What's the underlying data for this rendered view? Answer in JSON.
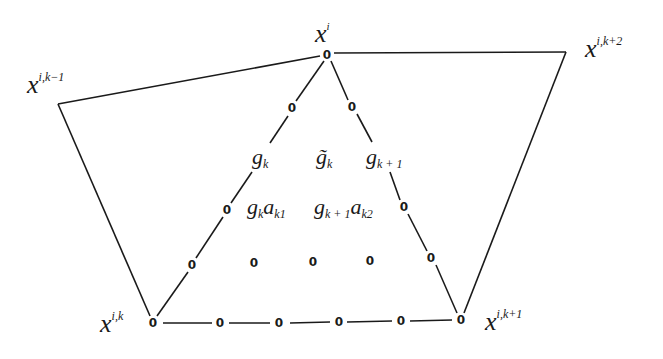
{
  "diagram": {
    "vertices": {
      "apex": {
        "label_base": "x",
        "label_sup": "i",
        "value": "0",
        "x": 327,
        "y": 54
      },
      "bottom_left": {
        "label_base": "x",
        "label_sup": "i,k",
        "value": "0",
        "x": 153,
        "y": 323
      },
      "bottom_right": {
        "label_base": "x",
        "label_sup": "i,k+1",
        "value": "0",
        "x": 461,
        "y": 320
      },
      "left_outer": {
        "label_base": "x",
        "label_sup": "i,k−1",
        "x": 58,
        "y": 104
      },
      "right_outer": {
        "label_base": "x",
        "label_sup": "i,k+2",
        "x": 566,
        "y": 52
      }
    },
    "left_edge_zeros": [
      {
        "value": "0",
        "x": 292,
        "y": 108
      },
      {
        "value": "0",
        "x": 227,
        "y": 210
      },
      {
        "value": "0",
        "x": 192,
        "y": 265
      }
    ],
    "right_edge_zeros": [
      {
        "value": "0",
        "x": 352,
        "y": 107
      },
      {
        "value": "0",
        "x": 404,
        "y": 207
      },
      {
        "value": "0",
        "x": 431,
        "y": 258
      }
    ],
    "bottom_edge_zeros": [
      {
        "value": "0",
        "x": 220,
        "y": 323
      },
      {
        "value": "0",
        "x": 278,
        "y": 323
      },
      {
        "value": "0",
        "x": 339,
        "y": 322
      },
      {
        "value": "0",
        "x": 400,
        "y": 321
      }
    ],
    "interior_zeros": [
      {
        "value": "0",
        "x": 254,
        "y": 263
      },
      {
        "value": "0",
        "x": 313,
        "y": 262
      },
      {
        "value": "0",
        "x": 370,
        "y": 261
      }
    ],
    "coefficient_labels": {
      "g_k_edge": {
        "base": "g",
        "sub": "k"
      },
      "g_tilde_k": {
        "base": "g̃",
        "sub": "k"
      },
      "g_k1_edge": {
        "base": "g",
        "sub": "k + 1"
      },
      "g_k_a_k1": {
        "base1": "g",
        "sub1": "k",
        "base2": "a",
        "sub2": "k1"
      },
      "g_k1_a_k2": {
        "base1": "g",
        "sub1": "k + 1",
        "base2": "a",
        "sub2": "k2"
      }
    }
  }
}
